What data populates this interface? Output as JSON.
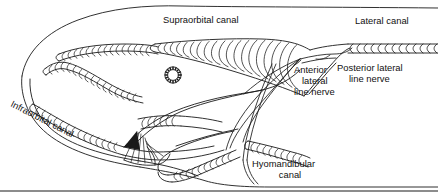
{
  "figure": {
    "style": "black-and-white ink line drawing",
    "background_color": "#ffffff",
    "line_color": "#1a1a1a",
    "width": 438,
    "height": 193
  },
  "labels": {
    "supraorbital_canal": "Supraorbital canal",
    "lateral_canal": "Lateral canal",
    "infraorbital_canal": "Infraorbital canal",
    "hyomandibular_canal_line1": "Hyomandibular",
    "hyomandibular_canal_line2": "canal",
    "anterior_nerve_line1": "Anterior",
    "anterior_nerve_line2": "lateral",
    "anterior_nerve_line3": "line nerve",
    "posterior_nerve_line1": "Posterior lateral",
    "posterior_nerve_line2": "line nerve"
  },
  "structures": [
    {
      "name": "head-outline",
      "label": null
    },
    {
      "name": "supraorbital-canal",
      "label": "Supraorbital canal"
    },
    {
      "name": "infraorbital-canal",
      "label": "Infraorbital canal"
    },
    {
      "name": "lateral-canal",
      "label": "Lateral canal"
    },
    {
      "name": "hyomandibular-canal",
      "label": "Hyomandibular canal"
    },
    {
      "name": "anterior-lateral-line-nerve",
      "label": "Anterior lateral line nerve"
    },
    {
      "name": "posterior-lateral-line-nerve",
      "label": "Posterior lateral line nerve"
    },
    {
      "name": "eye",
      "label": null
    },
    {
      "name": "preopercular-canal",
      "label": null
    },
    {
      "name": "mandible",
      "label": null
    }
  ]
}
